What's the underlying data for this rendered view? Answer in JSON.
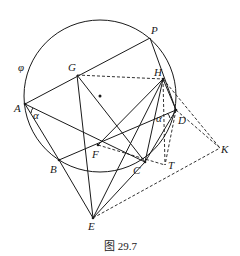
{
  "figure": {
    "caption": "图 29.7",
    "circle_label": "φ",
    "angle_label_A": "α",
    "angle_label_D": "α",
    "points": {
      "P": "P",
      "G": "G",
      "H": "H",
      "A": "A",
      "D": "D",
      "F": "F",
      "B": "B",
      "C": "C",
      "T": "T",
      "K": "K",
      "E": "E"
    }
  }
}
